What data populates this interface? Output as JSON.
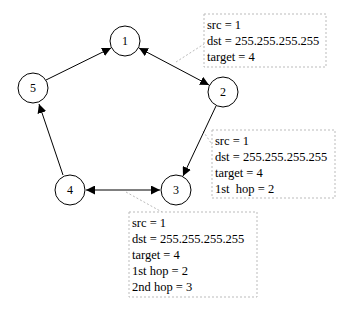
{
  "diagram": {
    "type": "network-graph",
    "nodes": [
      {
        "id": "1",
        "label": "1",
        "x": 125,
        "y": 41
      },
      {
        "id": "2",
        "label": "2",
        "x": 223,
        "y": 92
      },
      {
        "id": "3",
        "label": "3",
        "x": 176,
        "y": 190
      },
      {
        "id": "4",
        "label": "4",
        "x": 70,
        "y": 190
      },
      {
        "id": "5",
        "label": "5",
        "x": 33,
        "y": 88
      }
    ],
    "edges": [
      {
        "from": "5",
        "to": "1",
        "direction": "forward"
      },
      {
        "from": "1",
        "to": "2",
        "direction": "both"
      },
      {
        "from": "2",
        "to": "3",
        "direction": "forward"
      },
      {
        "from": "4",
        "to": "3",
        "direction": "both"
      },
      {
        "from": "4",
        "to": "5",
        "direction": "forward"
      }
    ],
    "annotations": [
      {
        "attached_to_edge": "1-2",
        "lines": [
          "src = 1",
          "dst = 255.255.255.255",
          "target = 4"
        ]
      },
      {
        "attached_to_edge": "2-3",
        "lines": [
          "src = 1",
          "dst = 255.255.255.255",
          "target = 4",
          "1st  hop = 2"
        ]
      },
      {
        "attached_to_edge": "4-3",
        "lines": [
          "src = 1",
          "dst = 255.255.255.255",
          "target = 4",
          "1st hop = 2",
          "2nd hop = 3"
        ]
      }
    ]
  }
}
